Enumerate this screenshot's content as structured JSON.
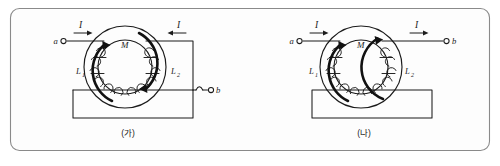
{
  "figure": {
    "background_color": "#ffffff",
    "frame_color": "#8a8a8a",
    "ink_color": "#1b1b1b",
    "width": 500,
    "height": 166
  },
  "panels": [
    {
      "id": "panel-ga",
      "caption": "(가)",
      "core_label": "M",
      "terminals": [
        {
          "name": "terminal-a",
          "label": "a",
          "side": "left"
        },
        {
          "name": "terminal-b",
          "label": "b",
          "side": "right"
        }
      ],
      "current_arrows": [
        {
          "name": "current-arrow-left",
          "label": "I",
          "direction": "right"
        },
        {
          "name": "current-arrow-right",
          "label": "I",
          "direction": "left"
        }
      ],
      "coils": [
        {
          "name": "coil-l1",
          "label": "L",
          "subscript": "1"
        },
        {
          "name": "coil-l2",
          "label": "L",
          "subscript": "2"
        }
      ],
      "flux_arrows": [
        {
          "name": "flux-arrow-left",
          "sense": "counterclockwise"
        },
        {
          "name": "flux-arrow-right",
          "sense": "clockwise"
        }
      ],
      "circuit": "open loop with wire hop before terminal b"
    },
    {
      "id": "panel-na",
      "caption": "(나)",
      "core_label": "M",
      "terminals": [
        {
          "name": "terminal-a",
          "label": "a",
          "side": "left"
        },
        {
          "name": "terminal-b",
          "label": "b",
          "side": "right"
        }
      ],
      "current_arrows": [
        {
          "name": "current-arrow-left",
          "label": "I",
          "direction": "right"
        },
        {
          "name": "current-arrow-right",
          "label": "I",
          "direction": "right"
        }
      ],
      "coils": [
        {
          "name": "coil-l1",
          "label": "L",
          "subscript": "1"
        },
        {
          "name": "coil-l2",
          "label": "L",
          "subscript": "2"
        }
      ],
      "flux_arrows": [
        {
          "name": "flux-arrow-left",
          "sense": "counterclockwise"
        },
        {
          "name": "flux-arrow-right",
          "sense": "counterclockwise"
        }
      ],
      "circuit": "closed rectangular return loop"
    }
  ]
}
